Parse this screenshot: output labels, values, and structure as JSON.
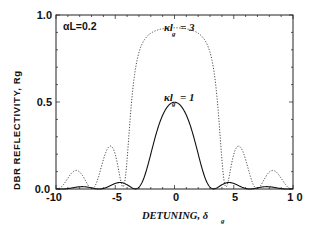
{
  "chart_data": {
    "type": "line",
    "title": "",
    "xlabel": "DETUNING, δ_g",
    "ylabel": "DBR REFLECTIVITY, Rg",
    "xlim": [
      -10,
      10
    ],
    "ylim": [
      0,
      1.0
    ],
    "x_ticks": [
      "-10",
      "-5",
      "0",
      "5",
      "10"
    ],
    "y_ticks": [
      "0.0",
      "0.5",
      "1.0"
    ],
    "grid": false,
    "annotation": "αL=0.2",
    "alphaL": 0.2,
    "series": [
      {
        "name": "κl_g = 1",
        "kappaL": 1,
        "style": "solid",
        "x": [
          -10,
          -8,
          -7,
          -5,
          -4.4,
          -3,
          -2,
          -1,
          0,
          1,
          2,
          3,
          4.4,
          5,
          7,
          8,
          10
        ],
        "values": [
          0.0,
          0.01,
          0.0,
          0.035,
          0.04,
          0.0,
          0.18,
          0.39,
          0.49,
          0.39,
          0.18,
          0.0,
          0.04,
          0.035,
          0.0,
          0.01,
          0.0
        ]
      },
      {
        "name": "κl_g = 3",
        "kappaL": 3,
        "style": "dotted",
        "x": [
          -10,
          -8.3,
          -7,
          -5.5,
          -4.2,
          -3.5,
          -3,
          -2,
          0,
          2,
          3,
          3.5,
          4.2,
          5.5,
          7,
          8.3,
          10
        ],
        "values": [
          0.0,
          0.11,
          0.0,
          0.25,
          0.0,
          0.45,
          0.78,
          0.9,
          0.92,
          0.9,
          0.78,
          0.45,
          0.0,
          0.25,
          0.0,
          0.11,
          0.0
        ]
      }
    ]
  },
  "labels": {
    "annotation": "αL=0.2",
    "ylabel": "DBR REFLECTIVITY, Rg",
    "xlabel": "DETUNING,  δ",
    "xlabel_sub": "g",
    "series1_main": "κl",
    "series1_eq": "= 1",
    "series1_sub": "g",
    "series3_main": "κl",
    "series3_eq": "= 3",
    "series3_sub": "g",
    "xt0": "-10",
    "xt1": "-5",
    "xt2": "0",
    "xt3": "5",
    "xt4": "1 0",
    "yt0": "0.0",
    "yt1": "0.5",
    "yt2": "1.0"
  }
}
